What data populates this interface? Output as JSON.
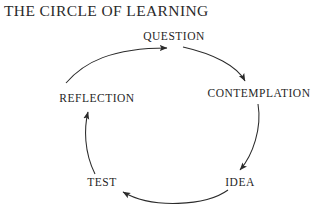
{
  "page": {
    "background_color": "#ffffff",
    "width": 324,
    "height": 220
  },
  "diagram": {
    "title": "THE CIRCLE OF LEARNING",
    "type": "cycle-diagram",
    "direction": "clockwise",
    "stroke_color": "#2b2b2b",
    "text_color": "#1f1f1f",
    "nodes": [
      {
        "id": "question",
        "label": "QUESTION",
        "x": 174,
        "y": 36
      },
      {
        "id": "contemplation",
        "label": "CONTEMPLATION",
        "x": 259,
        "y": 93
      },
      {
        "id": "idea",
        "label": "IDEA",
        "x": 240,
        "y": 182
      },
      {
        "id": "test",
        "label": "TEST",
        "x": 102,
        "y": 182
      },
      {
        "id": "reflection",
        "label": "REFLECTION",
        "x": 97,
        "y": 98
      }
    ],
    "arrows": [
      {
        "id": "reflection-to-question",
        "from": "reflection",
        "to": "question"
      },
      {
        "id": "question-to-contemplation",
        "from": "question",
        "to": "contemplation"
      },
      {
        "id": "contemplation-to-idea",
        "from": "contemplation",
        "to": "idea"
      },
      {
        "id": "idea-to-test",
        "from": "idea",
        "to": "test"
      },
      {
        "id": "test-to-reflection",
        "from": "test",
        "to": "reflection"
      }
    ]
  }
}
